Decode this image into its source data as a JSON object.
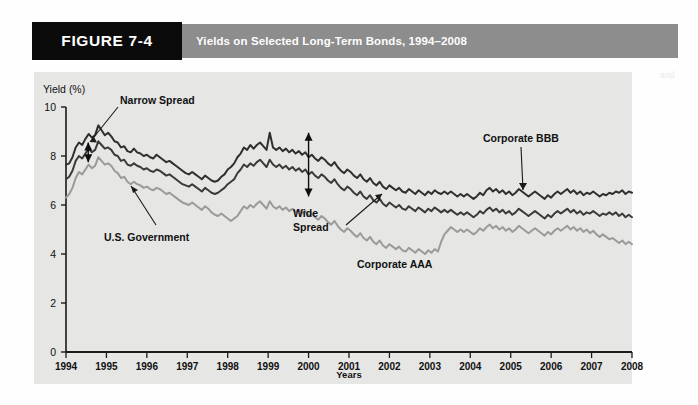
{
  "figure": {
    "tag_label": "FIGURE 7-4",
    "title": "Yields on Selected Long-Term Bonds, 1994–2008",
    "tag_bg": "#0b0b0b",
    "band_bg": "#8d8d8d",
    "panel_bg": "#e6e6e4"
  },
  "annotations": {
    "narrow_spread": "Narrow Spread",
    "wide_spread_line1": "Wide",
    "wide_spread_line2": "Spread",
    "us_government": "U.S. Government",
    "corporate_aaa": "Corporate AAA",
    "corporate_bbb": "Corporate BBB"
  },
  "ghost_text": [
    {
      "x": 120,
      "y": 86,
      "t": "the time when interest rates on the bonds are compared with those"
    },
    {
      "x": 210,
      "y": 100,
      "t": "a long period of time, the spread between"
    },
    {
      "x": 150,
      "y": 114,
      "t": "bonds of different quality can change considerably"
    },
    {
      "x": 300,
      "y": 128,
      "t": "for the risk associated with the lower rated issue"
    },
    {
      "x": 180,
      "y": 142,
      "t": "the yields on corporate and government securities"
    },
    {
      "x": 330,
      "y": 170,
      "t": "and the spread between them widens during recession"
    },
    {
      "x": 240,
      "y": 214,
      "t": "yields on the bonds and the spread between them"
    },
    {
      "x": 250,
      "y": 228,
      "t": "a measure of the risk premium investors require"
    },
    {
      "x": 228,
      "y": 242,
      "t": "the narrowing and widening of the spread over time"
    },
    {
      "x": 236,
      "y": 256,
      "t": "provides an indication of investor confidence"
    },
    {
      "x": 270,
      "y": 270,
      "t": "during periods of economic expansion"
    },
    {
      "x": 205,
      "y": 360,
      "t": "spread widens when economic conditions deteriorate"
    },
    {
      "x": 660,
      "y": 70,
      "t": "and"
    },
    {
      "x": 400,
      "y": 40,
      "t": ""
    }
  ],
  "chart_data": {
    "type": "line",
    "title": "Yields on Selected Long-Term Bonds, 1994–2008",
    "xlabel": "Years",
    "ylabel": "Yield (%)",
    "ylim": [
      0,
      10
    ],
    "yticks": [
      0,
      2,
      4,
      6,
      8,
      10
    ],
    "xlim": [
      1994,
      2008
    ],
    "xticks": [
      "1994",
      "1995",
      "1996",
      "1997",
      "1998",
      "1999",
      "2000",
      "2001",
      "2002",
      "2003",
      "2004",
      "2005",
      "2006",
      "2007",
      "2008"
    ],
    "grid": false,
    "legend": "none (inline annotations)",
    "series": [
      {
        "name": "Corporate BBB",
        "color": "#2f2f2f",
        "width": 2.0,
        "values": [
          7.65,
          7.7,
          7.95,
          8.35,
          8.55,
          8.45,
          8.7,
          8.9,
          8.75,
          8.85,
          9.25,
          9.05,
          8.85,
          8.95,
          8.8,
          8.6,
          8.55,
          8.35,
          8.4,
          8.2,
          8.15,
          8.3,
          8.15,
          8.1,
          8.0,
          8.05,
          7.95,
          7.9,
          8.05,
          7.95,
          7.85,
          7.75,
          7.8,
          7.7,
          7.6,
          7.5,
          7.4,
          7.3,
          7.25,
          7.35,
          7.25,
          7.15,
          7.05,
          7.2,
          7.1,
          7.0,
          6.95,
          7.0,
          7.15,
          7.25,
          7.45,
          7.55,
          7.7,
          7.95,
          8.1,
          8.35,
          8.25,
          8.45,
          8.3,
          8.45,
          8.55,
          8.4,
          8.25,
          8.95,
          8.35,
          8.25,
          8.35,
          8.2,
          8.3,
          8.15,
          8.25,
          8.1,
          8.2,
          8.05,
          8.15,
          7.95,
          8.05,
          7.9,
          7.8,
          7.95,
          7.85,
          7.7,
          7.6,
          7.75,
          7.55,
          7.4,
          7.3,
          7.45,
          7.35,
          7.2,
          7.1,
          7.25,
          7.05,
          6.95,
          7.1,
          6.9,
          6.8,
          6.95,
          6.75,
          6.65,
          6.8,
          6.7,
          6.6,
          6.7,
          6.55,
          6.5,
          6.65,
          6.55,
          6.45,
          6.6,
          6.5,
          6.4,
          6.55,
          6.45,
          6.6,
          6.5,
          6.45,
          6.55,
          6.45,
          6.55,
          6.45,
          6.35,
          6.45,
          6.35,
          6.45,
          6.35,
          6.25,
          6.35,
          6.5,
          6.4,
          6.6,
          6.7,
          6.55,
          6.65,
          6.5,
          6.6,
          6.45,
          6.55,
          6.4,
          6.5,
          6.65,
          6.55,
          6.45,
          6.35,
          6.45,
          6.55,
          6.45,
          6.35,
          6.25,
          6.4,
          6.3,
          6.45,
          6.55,
          6.45,
          6.55,
          6.65,
          6.5,
          6.6,
          6.45,
          6.55,
          6.4,
          6.5,
          6.45,
          6.55,
          6.45,
          6.35,
          6.45,
          6.4,
          6.5,
          6.45,
          6.55,
          6.5,
          6.6,
          6.45,
          6.55,
          6.5
        ]
      },
      {
        "name": "Corporate AAA",
        "color": "#3a3a3a",
        "width": 2.0,
        "values": [
          7.05,
          7.15,
          7.4,
          7.8,
          8.0,
          7.9,
          8.1,
          8.3,
          8.15,
          8.25,
          8.6,
          8.45,
          8.3,
          8.35,
          8.25,
          8.05,
          8.0,
          7.8,
          7.85,
          7.65,
          7.6,
          7.7,
          7.6,
          7.55,
          7.45,
          7.5,
          7.4,
          7.35,
          7.45,
          7.4,
          7.3,
          7.2,
          7.25,
          7.15,
          7.05,
          6.95,
          6.85,
          6.8,
          6.75,
          6.85,
          6.75,
          6.65,
          6.55,
          6.7,
          6.6,
          6.5,
          6.45,
          6.5,
          6.6,
          6.7,
          6.85,
          6.95,
          7.05,
          7.3,
          7.45,
          7.65,
          7.55,
          7.7,
          7.6,
          7.75,
          7.85,
          7.7,
          7.55,
          7.85,
          7.65,
          7.55,
          7.65,
          7.5,
          7.6,
          7.45,
          7.55,
          7.4,
          7.5,
          7.35,
          7.45,
          7.25,
          7.35,
          7.2,
          7.1,
          7.25,
          7.15,
          7.0,
          6.9,
          7.05,
          6.85,
          6.7,
          6.6,
          6.75,
          6.65,
          6.5,
          6.4,
          6.55,
          6.35,
          6.25,
          6.4,
          6.2,
          6.1,
          6.25,
          6.05,
          5.95,
          6.1,
          6.0,
          5.9,
          6.0,
          5.85,
          5.8,
          5.95,
          5.85,
          5.75,
          5.9,
          5.8,
          5.7,
          5.85,
          5.75,
          5.9,
          5.8,
          5.7,
          5.8,
          5.7,
          5.8,
          5.7,
          5.6,
          5.7,
          5.6,
          5.7,
          5.6,
          5.5,
          5.6,
          5.75,
          5.65,
          5.8,
          5.9,
          5.75,
          5.85,
          5.7,
          5.8,
          5.65,
          5.75,
          5.6,
          5.7,
          5.85,
          5.75,
          5.65,
          5.55,
          5.65,
          5.75,
          5.65,
          5.55,
          5.45,
          5.6,
          5.5,
          5.65,
          5.75,
          5.65,
          5.75,
          5.85,
          5.7,
          5.8,
          5.65,
          5.75,
          5.6,
          5.7,
          5.65,
          5.75,
          5.65,
          5.55,
          5.65,
          5.6,
          5.7,
          5.6,
          5.7,
          5.55,
          5.65,
          5.5,
          5.6,
          5.5
        ]
      },
      {
        "name": "U.S. Government",
        "color": "#9a9a9a",
        "width": 2.0,
        "values": [
          6.3,
          6.45,
          6.7,
          7.1,
          7.35,
          7.25,
          7.45,
          7.65,
          7.5,
          7.6,
          7.95,
          7.8,
          7.65,
          7.7,
          7.6,
          7.4,
          7.3,
          7.1,
          7.15,
          6.95,
          6.85,
          6.95,
          6.85,
          6.8,
          6.7,
          6.75,
          6.65,
          6.6,
          6.7,
          6.65,
          6.55,
          6.45,
          6.5,
          6.4,
          6.3,
          6.2,
          6.1,
          6.05,
          6.0,
          6.1,
          6.0,
          5.9,
          5.8,
          5.95,
          5.85,
          5.7,
          5.6,
          5.55,
          5.65,
          5.55,
          5.45,
          5.35,
          5.45,
          5.55,
          5.75,
          5.95,
          5.85,
          6.0,
          5.9,
          6.05,
          6.15,
          6.0,
          5.85,
          6.15,
          5.95,
          5.85,
          5.95,
          5.8,
          5.9,
          5.75,
          5.85,
          5.7,
          5.8,
          5.65,
          5.75,
          5.55,
          5.65,
          5.5,
          5.4,
          5.55,
          5.45,
          5.3,
          5.2,
          5.35,
          5.15,
          5.0,
          4.9,
          5.05,
          4.95,
          4.8,
          4.7,
          4.85,
          4.65,
          4.55,
          4.7,
          4.5,
          4.4,
          4.55,
          4.35,
          4.25,
          4.4,
          4.3,
          4.2,
          4.3,
          4.15,
          4.1,
          4.25,
          4.15,
          4.05,
          4.2,
          4.1,
          4.0,
          4.15,
          4.05,
          4.2,
          4.1,
          4.5,
          4.8,
          4.95,
          5.1,
          5.0,
          4.9,
          5.0,
          4.9,
          5.0,
          4.9,
          4.8,
          4.9,
          5.05,
          4.95,
          5.1,
          5.2,
          5.05,
          5.15,
          5.0,
          5.1,
          4.95,
          5.05,
          4.9,
          5.0,
          5.15,
          5.05,
          4.95,
          4.85,
          4.95,
          5.05,
          4.95,
          4.85,
          4.75,
          4.9,
          4.8,
          4.95,
          5.05,
          4.95,
          5.05,
          5.15,
          5.0,
          5.1,
          4.95,
          5.05,
          4.9,
          5.0,
          4.85,
          4.95,
          4.8,
          4.7,
          4.8,
          4.7,
          4.6,
          4.65,
          4.55,
          4.45,
          4.55,
          4.4,
          4.5,
          4.4
        ]
      }
    ],
    "markers": [
      {
        "name": "narrow-spread",
        "type": "double-arrow",
        "x_year": 1994.55,
        "y_top": 8.55,
        "y_bottom": 7.75
      },
      {
        "name": "wide-spread",
        "type": "double-arrow",
        "x_year": 2000.0,
        "y_top": 8.95,
        "y_bottom": 6.35
      }
    ]
  }
}
